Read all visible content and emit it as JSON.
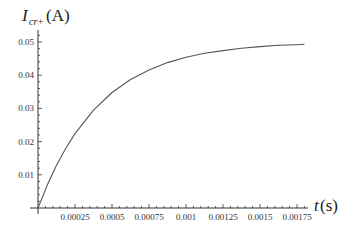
{
  "chart_data": {
    "type": "line",
    "title": "",
    "xlabel": "t(s)",
    "ylabel": "I_{cr+}(A)",
    "ylabel_parts": {
      "main": "I",
      "sub": "cr+",
      "unit": "(A)"
    },
    "xlabel_parts": {
      "main": "t",
      "unit": "(s)"
    },
    "xlim": [
      0,
      0.0018
    ],
    "ylim": [
      0,
      0.052
    ],
    "grid": false,
    "legend": null,
    "x_ticks": [
      0.00025,
      0.0005,
      0.00075,
      0.001,
      0.00125,
      0.0015,
      0.00175
    ],
    "x_tick_labels": [
      "0.00025",
      "0.0005",
      "0.00075",
      "0.001",
      "0.00125",
      "0.0015",
      "0.00175"
    ],
    "y_ticks": [
      0.01,
      0.02,
      0.03,
      0.04,
      0.05
    ],
    "y_tick_labels": [
      "0.01",
      "0.02",
      "0.03",
      "0.04",
      "0.05"
    ],
    "series": [
      {
        "name": "I_cr+",
        "color": "#555555",
        "x": [
          0,
          6.25e-05,
          0.000125,
          0.0001875,
          0.00025,
          0.000375,
          0.0005,
          0.000625,
          0.00075,
          0.000875,
          0.001,
          0.001125,
          0.00125,
          0.001375,
          0.0015,
          0.001625,
          0.00175,
          0.0018
        ],
        "y": [
          0,
          0.0069,
          0.0129,
          0.018,
          0.0224,
          0.0295,
          0.0348,
          0.0387,
          0.0416,
          0.0438,
          0.0454,
          0.0466,
          0.0474,
          0.0481,
          0.0486,
          0.049,
          0.0492,
          0.0493
        ]
      }
    ]
  }
}
